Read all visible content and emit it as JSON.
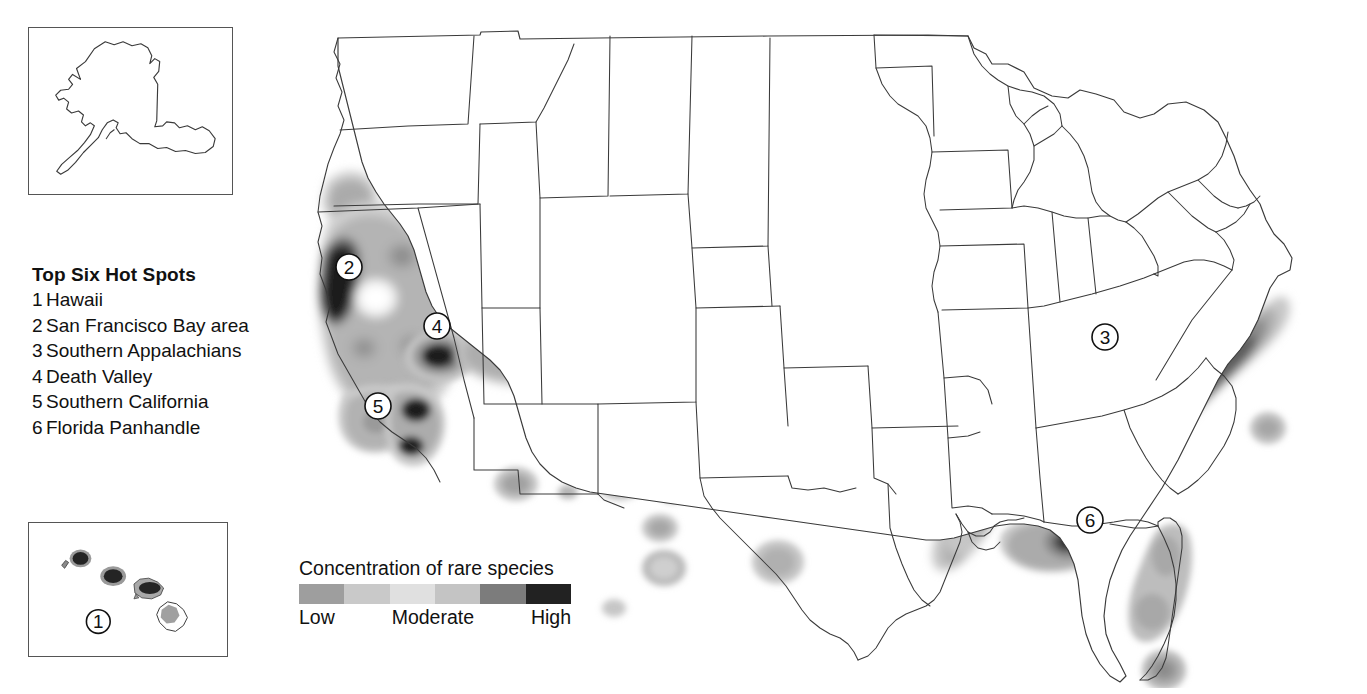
{
  "hotspots": {
    "title": "Top Six Hot Spots",
    "items": [
      {
        "num": "1",
        "label": "Hawaii"
      },
      {
        "num": "2",
        "label": "San Francisco Bay area"
      },
      {
        "num": "3",
        "label": "Southern Appalachians"
      },
      {
        "num": "4",
        "label": "Death Valley"
      },
      {
        "num": "5",
        "label": "Southern California"
      },
      {
        "num": "6",
        "label": "Florida Panhandle"
      }
    ]
  },
  "legend": {
    "title": "Concentration of rare species",
    "low_label": "Low",
    "moderate_label": "Moderate",
    "high_label": "High",
    "ramp_colors": [
      "#9e9e9e",
      "#c9c9c9",
      "#e0e0e0",
      "#c4c4c4",
      "#7c7c7c",
      "#222222"
    ]
  },
  "insets": {
    "alaska": {
      "name": "Alaska"
    },
    "hawaii": {
      "name": "Hawaii",
      "marker": "1"
    }
  },
  "map": {
    "markers": [
      {
        "id": "2",
        "label": "2",
        "x": 349,
        "y": 267,
        "region": "San Francisco Bay area"
      },
      {
        "id": "4",
        "label": "4",
        "x": 437,
        "y": 326,
        "region": "Death Valley"
      },
      {
        "id": "5",
        "label": "5",
        "x": 378,
        "y": 406,
        "region": "Southern California"
      },
      {
        "id": "3",
        "label": "3",
        "x": 1105,
        "y": 337,
        "region": "Southern Appalachians"
      },
      {
        "id": "6",
        "label": "6",
        "x": 1090,
        "y": 520,
        "region": "Florida Panhandle"
      }
    ],
    "shading_levels": {
      "level1": "#c8c8c8",
      "level2": "#b0b0b0",
      "level3": "#949494",
      "level4": "#6e6e6e",
      "level5": "#3a3a3a",
      "level6": "#1a1a1a"
    }
  }
}
